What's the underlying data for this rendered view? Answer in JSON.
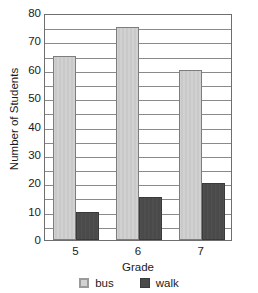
{
  "chart_data": {
    "type": "bar",
    "title": "",
    "title_note": "title cropped off above top edge of image",
    "xlabel": "Grade",
    "ylabel": "Number of Students",
    "categories": [
      "5",
      "6",
      "7"
    ],
    "series": [
      {
        "name": "bus",
        "values": [
          65,
          75,
          60
        ],
        "color": "#c9c9c9"
      },
      {
        "name": "walk",
        "values": [
          10,
          15,
          20
        ],
        "color": "#4a4a4a"
      }
    ],
    "ylim": [
      0,
      80
    ],
    "y_tick_step": 10,
    "y_tick_labels": [
      "80",
      "70",
      "60",
      "50",
      "40",
      "30",
      "20",
      "10",
      "0"
    ],
    "gridline_step": 5,
    "grid": true,
    "legend_position": "bottom",
    "legend": [
      {
        "label": "bus",
        "color": "#c9c9c9"
      },
      {
        "label": "walk",
        "color": "#4a4a4a"
      }
    ]
  }
}
